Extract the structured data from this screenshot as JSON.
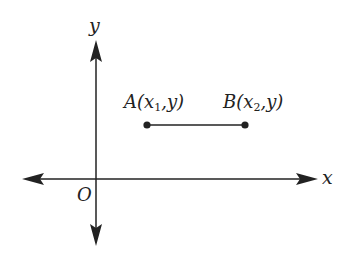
{
  "diagram": {
    "axes": {
      "x_label": "x",
      "y_label": "y",
      "origin_label": "O"
    },
    "points": [
      {
        "name": "A",
        "open": "(",
        "var": "x",
        "sub": "1",
        "rest": ",y)"
      },
      {
        "name": "B",
        "open": "(",
        "var": "x",
        "sub": "2",
        "rest": ",y)"
      }
    ],
    "colors": {
      "stroke": "#222222",
      "background": "#ffffff"
    }
  }
}
